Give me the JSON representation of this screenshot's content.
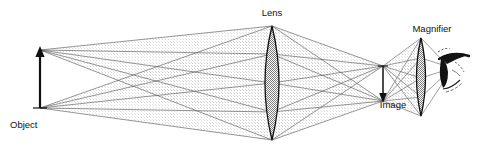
{
  "figure": {
    "background_color": "#ffffff",
    "line_color": "#1a1a1a",
    "ray_color": "#4a4a4a",
    "cone_fill_color": "#d9d9d9",
    "lens_fill_color": "#9a9a9a",
    "width": 480,
    "height": 148
  },
  "labels": {
    "object": "Object",
    "lens": "Lens",
    "image": "Image",
    "magnifier": "Magnifier"
  },
  "elements": {
    "object_arrow": {
      "name": "Object",
      "direction": "up",
      "base_x": 40,
      "base_y": 108,
      "tip_x": 40,
      "tip_y": 50
    },
    "objective_lens": {
      "name": "Lens",
      "type": "biconvex",
      "center_x": 272,
      "top_y": 26,
      "bottom_y": 140,
      "half_width": 14
    },
    "image_arrow": {
      "name": "Image",
      "direction": "down",
      "top_x": 383,
      "top_y": 66,
      "bottom_x": 383,
      "bottom_y": 101,
      "inverted": true
    },
    "magnifier_lens": {
      "name": "Magnifier",
      "type": "biconvex",
      "center_x": 421,
      "top_y": 38,
      "bottom_y": 116,
      "half_width": 9
    },
    "eye": {
      "name": "eye",
      "center_x": 452,
      "center_y": 72
    }
  },
  "optics_notes": {
    "ray_bundles": 2,
    "bundle_1_source": "object tip",
    "bundle_2_source": "object base",
    "image_type": "real inverted",
    "rays_per_bundle": 5
  }
}
